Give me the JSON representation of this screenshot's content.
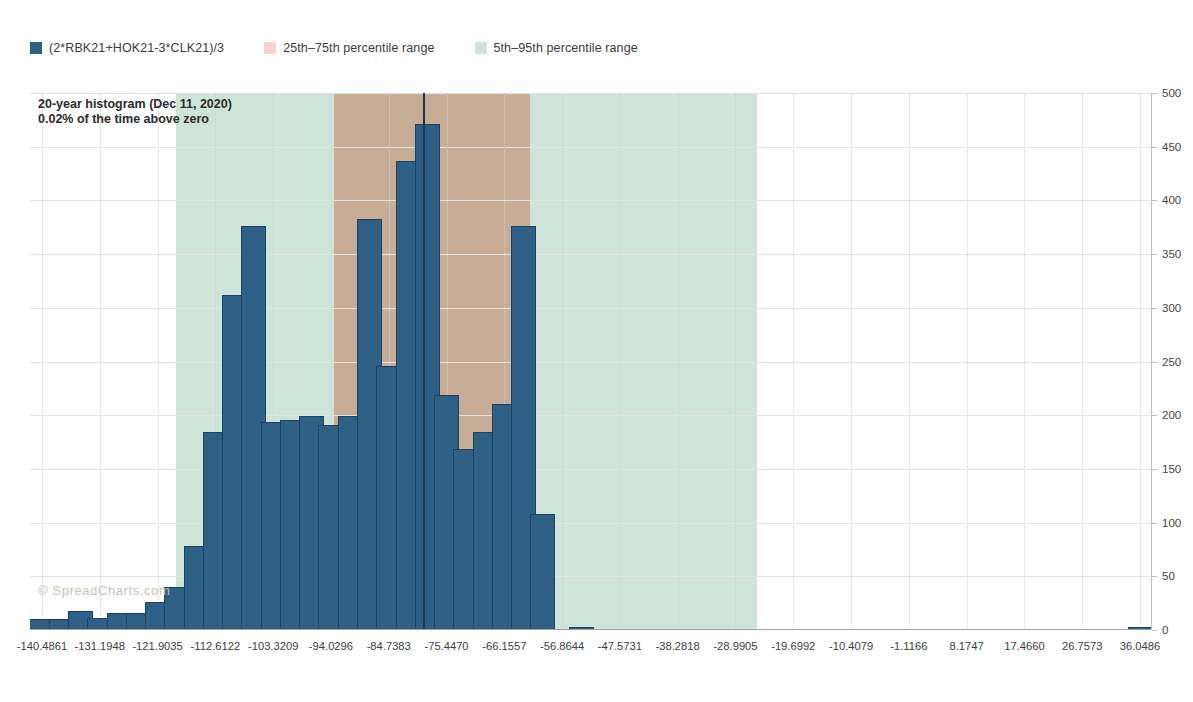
{
  "legend": {
    "items": [
      {
        "label": "(2*RBK21+HOK21-3*CLK21)/3",
        "color": "#2e6086",
        "icon": "square-swatch"
      },
      {
        "label": "25th–75th percentile range",
        "color": "#f6d5cb",
        "icon": "square-swatch"
      },
      {
        "label": "5th–95th percentile range",
        "color": "#cfe4d8",
        "icon": "square-swatch"
      }
    ]
  },
  "annotation": {
    "line1": "20-year histogram (Dec 11, 2020)",
    "line2": "0.02% of the time above zero"
  },
  "watermark": "© SpreadCharts.com",
  "colors": {
    "bar": "#2e6086",
    "bar_outline": "#1d4261",
    "band_outer": "#cfe4d8",
    "band_inner": "#c8ad96",
    "marker_line": "#1b3550",
    "gridline": "#e3e3e3"
  },
  "chart_data": {
    "type": "bar",
    "title": "20-year histogram (Dec 11, 2020)",
    "subtitle": "0.02% of the time above zero",
    "xlabel": "",
    "ylabel": "",
    "ylim": [
      0,
      500
    ],
    "yticks": [
      0,
      50,
      100,
      150,
      200,
      250,
      300,
      350,
      400,
      450,
      500
    ],
    "grid": true,
    "legend_position": "top-left",
    "series_name": "(2*RBK21+HOK21-3*CLK21)/3",
    "bin_width": 3.0971,
    "x_tick_labels": [
      "-140.4861",
      "-131.1948",
      "-121.9035",
      "-112.6122",
      "-103.3209",
      "-94.0296",
      "-84.7383",
      "-75.4470",
      "-66.1557",
      "-56.8644",
      "-47.5731",
      "-38.2818",
      "-28.9905",
      "-19.6992",
      "-10.4079",
      "-1.1166",
      "8.1747",
      "17.4660",
      "26.7573",
      "36.0486"
    ],
    "x_tick_values": [
      -140.4861,
      -131.1948,
      -121.9035,
      -112.6122,
      -103.3209,
      -94.0296,
      -84.7383,
      -75.447,
      -66.1557,
      -56.8644,
      -47.5731,
      -38.2818,
      -28.9905,
      -19.6992,
      -10.4079,
      -1.1166,
      8.1747,
      17.466,
      26.7573,
      36.0486
    ],
    "bins": [
      {
        "center": -140.49,
        "value": 10
      },
      {
        "center": -137.39,
        "value": 10
      },
      {
        "center": -134.29,
        "value": 18
      },
      {
        "center": -131.19,
        "value": 11
      },
      {
        "center": -128.1,
        "value": 16
      },
      {
        "center": -125.0,
        "value": 16
      },
      {
        "center": -121.9,
        "value": 26
      },
      {
        "center": -118.81,
        "value": 40
      },
      {
        "center": -115.71,
        "value": 78
      },
      {
        "center": -112.61,
        "value": 184
      },
      {
        "center": -109.51,
        "value": 312
      },
      {
        "center": -106.42,
        "value": 376
      },
      {
        "center": -103.32,
        "value": 194
      },
      {
        "center": -100.22,
        "value": 196
      },
      {
        "center": -97.13,
        "value": 199
      },
      {
        "center": -94.03,
        "value": 191
      },
      {
        "center": -90.93,
        "value": 199
      },
      {
        "center": -87.83,
        "value": 383
      },
      {
        "center": -84.74,
        "value": 246
      },
      {
        "center": -81.64,
        "value": 437
      },
      {
        "center": -78.54,
        "value": 471
      },
      {
        "center": -75.45,
        "value": 219
      },
      {
        "center": -72.35,
        "value": 169
      },
      {
        "center": -69.25,
        "value": 184
      },
      {
        "center": -66.16,
        "value": 210
      },
      {
        "center": -63.06,
        "value": 376
      },
      {
        "center": -59.96,
        "value": 108
      },
      {
        "center": -56.86,
        "value": 0
      },
      {
        "center": -53.77,
        "value": 3
      },
      {
        "center": -50.67,
        "value": 0
      },
      {
        "center": -47.57,
        "value": 0
      },
      {
        "center": -44.48,
        "value": 0
      },
      {
        "center": -41.38,
        "value": 0
      },
      {
        "center": -38.28,
        "value": 0
      },
      {
        "center": -35.19,
        "value": 0
      },
      {
        "center": -32.09,
        "value": 0
      },
      {
        "center": -28.99,
        "value": 0
      },
      {
        "center": -25.89,
        "value": 0
      },
      {
        "center": -22.8,
        "value": 0
      },
      {
        "center": -19.7,
        "value": 0
      },
      {
        "center": -16.6,
        "value": 0
      },
      {
        "center": -13.51,
        "value": 0
      },
      {
        "center": -10.41,
        "value": 0
      },
      {
        "center": -7.31,
        "value": 0
      },
      {
        "center": -4.21,
        "value": 0
      },
      {
        "center": -1.12,
        "value": 0
      },
      {
        "center": 1.98,
        "value": 0
      },
      {
        "center": 5.08,
        "value": 0
      },
      {
        "center": 8.17,
        "value": 0
      },
      {
        "center": 11.27,
        "value": 0
      },
      {
        "center": 14.37,
        "value": 0
      },
      {
        "center": 17.47,
        "value": 0
      },
      {
        "center": 20.56,
        "value": 0
      },
      {
        "center": 23.66,
        "value": 0
      },
      {
        "center": 26.76,
        "value": 0
      },
      {
        "center": 29.86,
        "value": 0
      },
      {
        "center": 32.95,
        "value": 0
      },
      {
        "center": 36.05,
        "value": 3
      }
    ],
    "bands": [
      {
        "name": "5th–95th percentile range",
        "from": -119.0,
        "to": -25.5,
        "color": "#cfe4d8"
      },
      {
        "name": "25th–75th percentile range",
        "from": -93.5,
        "to": -62.0,
        "color": "#c8ad96"
      }
    ],
    "marker": {
      "name": "current-value",
      "x": -79.0
    }
  }
}
